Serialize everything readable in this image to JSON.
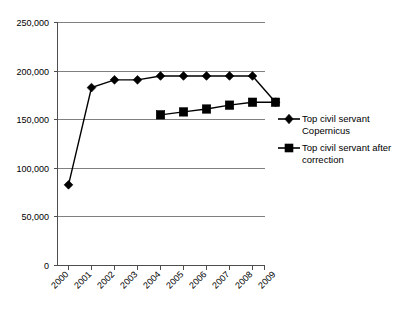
{
  "chart_data": {
    "type": "line",
    "title": "",
    "xlabel": "",
    "ylabel": "",
    "categories": [
      "2000",
      "2001",
      "2002",
      "2003",
      "2004",
      "2005",
      "2006",
      "2007",
      "2008",
      "2009"
    ],
    "ylim": [
      0,
      250000
    ],
    "yticks": [
      0,
      50000,
      100000,
      150000,
      200000,
      250000
    ],
    "ytick_labels": [
      "0",
      "50,000",
      "100,000",
      "150,000",
      "200,000",
      "250,000"
    ],
    "grid": true,
    "legend_position": "right",
    "series": [
      {
        "name": "Top civil servant Copernicus",
        "marker": "diamond",
        "color": "#000000",
        "values": [
          83000,
          183000,
          191000,
          191000,
          195000,
          195000,
          195000,
          195000,
          195000,
          168000
        ]
      },
      {
        "name": "Top civil servant after correction",
        "marker": "square",
        "color": "#000000",
        "values": [
          null,
          null,
          null,
          null,
          155000,
          158000,
          161000,
          165000,
          168000,
          168000
        ]
      }
    ]
  },
  "legend": {
    "entries": [
      {
        "line1": "Top civil servant",
        "line2": "Copernicus",
        "marker": "diamond-marker-icon"
      },
      {
        "line1": "Top civil servant after",
        "line2": "correction",
        "marker": "square-marker-icon"
      }
    ]
  },
  "colors": {
    "series": "#000000",
    "gridline": "#808080",
    "axis": "#4d4d4d",
    "background": "#ffffff"
  }
}
